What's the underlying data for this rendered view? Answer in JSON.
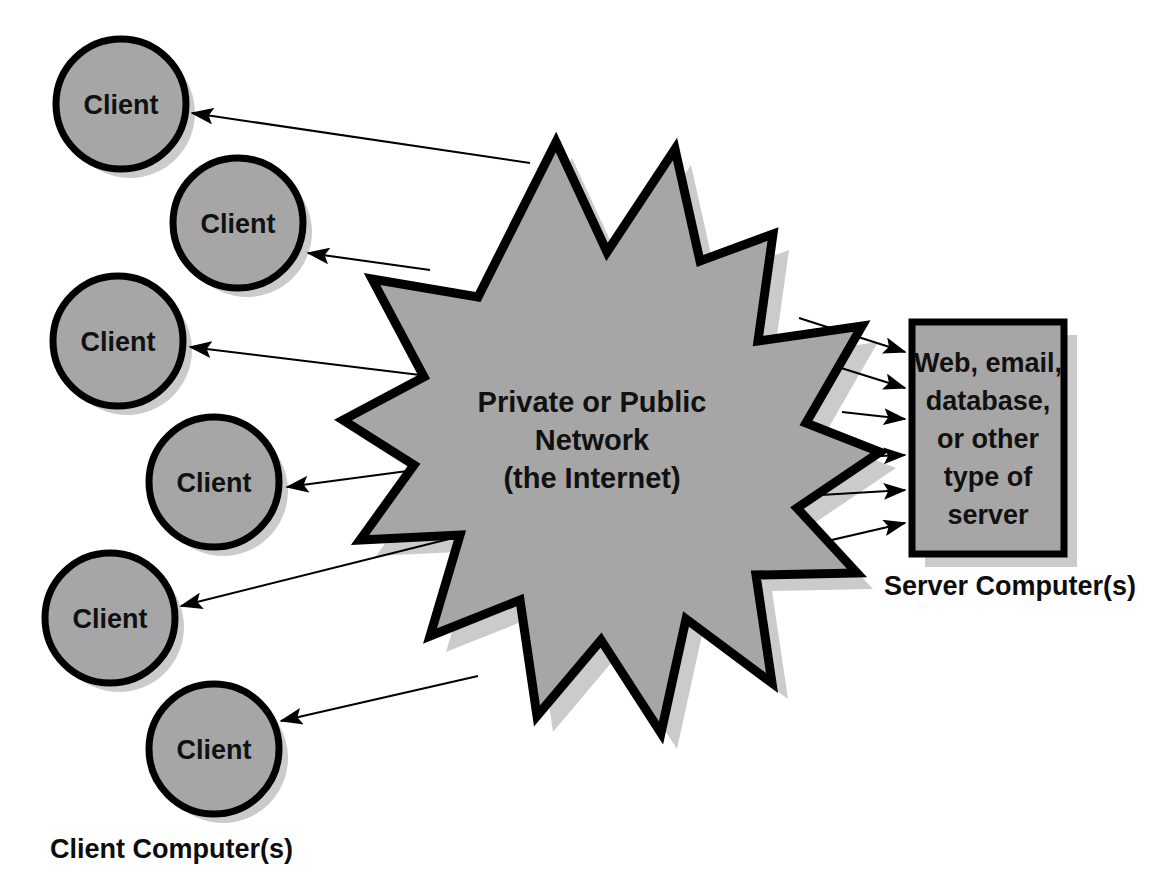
{
  "diagram": {
    "background_color": "#ffffff",
    "fill_color": "#a6a6a6",
    "stroke_color": "#000000",
    "shadow_color": "#c9c9c9",
    "text_color": "#111111"
  },
  "network": {
    "shape": "starburst",
    "points": 10,
    "label_lines": [
      "Private or Public",
      "Network",
      "(the Internet)"
    ],
    "label_line_1": "Private or Public",
    "label_line_2": "Network",
    "label_line_3": "(the Internet)"
  },
  "clients": {
    "caption": "Client Computer(s)",
    "items": [
      {
        "label": "Client"
      },
      {
        "label": "Client"
      },
      {
        "label": "Client"
      },
      {
        "label": "Client"
      },
      {
        "label": "Client"
      },
      {
        "label": "Client"
      }
    ]
  },
  "server": {
    "caption": "Server Computer(s)",
    "shape": "rectangle",
    "label_lines": [
      "Web, email,",
      "database,",
      "or other",
      "type of",
      "server"
    ],
    "label_line_1": "Web, email,",
    "label_line_2": "database,",
    "label_line_3": "or other",
    "label_line_4": "type of",
    "label_line_5": "server"
  },
  "connections": {
    "client_arrow_count": 6,
    "server_arrow_count": 6,
    "client_arrow_direction": "network-to-client",
    "server_arrow_direction": "network-to-server"
  }
}
